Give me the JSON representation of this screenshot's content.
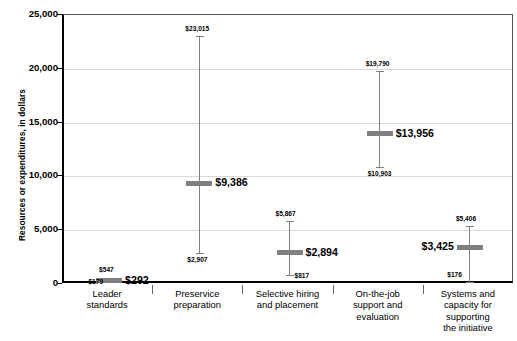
{
  "chart_data": {
    "type": "bar",
    "title": "",
    "xlabel": "",
    "ylabel": "Resources or expenditures, in dollars",
    "ylim": [
      0,
      25000
    ],
    "ytick_values": [
      0,
      5000,
      10000,
      15000,
      20000,
      25000
    ],
    "ytick_labels": [
      "0",
      "5,000",
      "10,000",
      "15,000",
      "20,000",
      "25,000"
    ],
    "grid": true,
    "legend": "none",
    "categories": [
      "Leader standards",
      "Preservice preparation",
      "Selective hiring and placement",
      "On-the-job support and evaluation",
      "Systems and capacity for supporting the initiative"
    ],
    "category_lines": [
      [
        "Leader",
        "standards"
      ],
      [
        "Preservice",
        "preparation"
      ],
      [
        "Selective hiring",
        "and placement"
      ],
      [
        "On-the-job",
        "support and",
        "evaluation"
      ],
      [
        "Systems and",
        "capacity for",
        "supporting",
        "the initiative"
      ]
    ],
    "series": [
      {
        "name": "minimum",
        "values": [
          179,
          2907,
          817,
          10903,
          176
        ]
      },
      {
        "name": "median",
        "values": [
          292,
          9386,
          2894,
          13956,
          3425
        ]
      },
      {
        "name": "maximum",
        "values": [
          547,
          23015,
          5867,
          19790,
          5406
        ]
      }
    ],
    "points": [
      {
        "category": "Leader standards",
        "min": 179,
        "median": 292,
        "max": 547,
        "min_label": "$179",
        "median_label": "$292",
        "max_label": "$547"
      },
      {
        "category": "Preservice preparation",
        "min": 2907,
        "median": 9386,
        "max": 23015,
        "min_label": "$2,907",
        "median_label": "$9,386",
        "max_label": "$23,015"
      },
      {
        "category": "Selective hiring and placement",
        "min": 817,
        "median": 2894,
        "max": 5867,
        "min_label": "$817",
        "median_label": "$2,894",
        "max_label": "$5,867"
      },
      {
        "category": "On-the-job support and evaluation",
        "min": 10903,
        "median": 13956,
        "max": 19790,
        "min_label": "$10,903",
        "median_label": "$13,956",
        "max_label": "$19,790"
      },
      {
        "category": "Systems and capacity for supporting the initiative",
        "min": 176,
        "median": 3425,
        "max": 5406,
        "min_label": "$176",
        "median_label": "$3,425",
        "max_label": "$5,406"
      }
    ],
    "colors": {
      "marker": "#808080",
      "axis": "#000000",
      "gridline": "#d9d9d9",
      "text": "#000000",
      "background": "#ffffff"
    }
  }
}
